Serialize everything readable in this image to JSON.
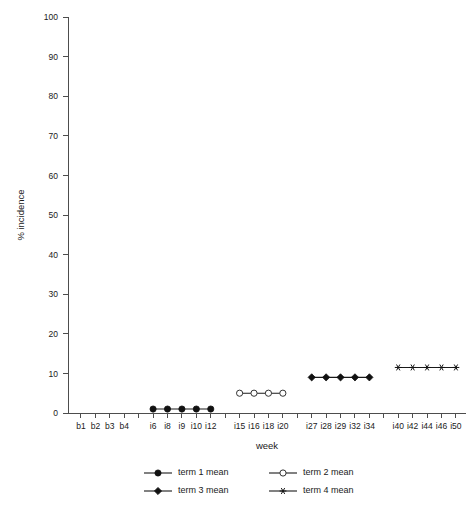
{
  "chart_data": {
    "type": "line",
    "title": "",
    "xlabel": "week",
    "ylabel": "% incidence",
    "ylim": [
      0,
      100
    ],
    "ytick_values": [
      0,
      10,
      20,
      30,
      40,
      50,
      60,
      70,
      80,
      90,
      100
    ],
    "ytick_labels": [
      "0",
      "10",
      "20",
      "30",
      "40",
      "50",
      "60",
      "70",
      "80",
      "90",
      "100"
    ],
    "grid": false,
    "legend_position": "bottom",
    "categories": [
      "b1",
      "b2",
      "b3",
      "b4",
      "",
      "i6",
      "i8",
      "i9",
      "i10",
      "i12",
      "",
      "i15",
      "i16",
      "i18",
      "i20",
      "",
      "i27",
      "i28",
      "i29",
      "i32",
      "i34",
      "",
      "i40",
      "i42",
      "i44",
      "i46",
      "i50"
    ],
    "xtick_labels": [
      "b1",
      "b2",
      "b3",
      "b4",
      "",
      "i6",
      "i8",
      "i9",
      "i10",
      "i12",
      "",
      "i15",
      "i16",
      "i18",
      "i20",
      "",
      "i27",
      "i28",
      "i29",
      "i32",
      "i34",
      "",
      "i40",
      "i42",
      "i44",
      "i46",
      "i50"
    ],
    "series": [
      {
        "name": "term 1 mean",
        "marker": "filled-circle",
        "x": [
          "i6",
          "i8",
          "i9",
          "i10",
          "i12"
        ],
        "x_index": [
          5,
          6,
          7,
          8,
          9
        ],
        "values": [
          1,
          1,
          1,
          1,
          1
        ]
      },
      {
        "name": "term 2 mean",
        "marker": "open-circle",
        "x": [
          "i15",
          "i16",
          "i18",
          "i20"
        ],
        "x_index": [
          11,
          12,
          13,
          14
        ],
        "values": [
          5,
          5,
          5,
          5
        ]
      },
      {
        "name": "term 3 mean",
        "marker": "filled-diamond",
        "x": [
          "i27",
          "i28",
          "i29",
          "i32",
          "i34"
        ],
        "x_index": [
          16,
          17,
          18,
          19,
          20
        ],
        "values": [
          9,
          9,
          9,
          9,
          9
        ]
      },
      {
        "name": "term 4 mean",
        "marker": "star",
        "x": [
          "i40",
          "i42",
          "i44",
          "i46",
          "i50"
        ],
        "x_index": [
          22,
          23,
          24,
          25,
          26
        ],
        "values": [
          11.5,
          11.5,
          11.5,
          11.5,
          11.5
        ]
      }
    ]
  },
  "legend": {
    "entries": [
      {
        "label": "term 1 mean",
        "marker": "filled-circle"
      },
      {
        "label": "term 2 mean",
        "marker": "open-circle"
      },
      {
        "label": "term 3 mean",
        "marker": "filled-diamond"
      },
      {
        "label": "term 4 mean",
        "marker": "star"
      }
    ]
  },
  "colors": {
    "axis": "#4d4d4d",
    "marker": "#111111",
    "background": "#ffffff"
  }
}
